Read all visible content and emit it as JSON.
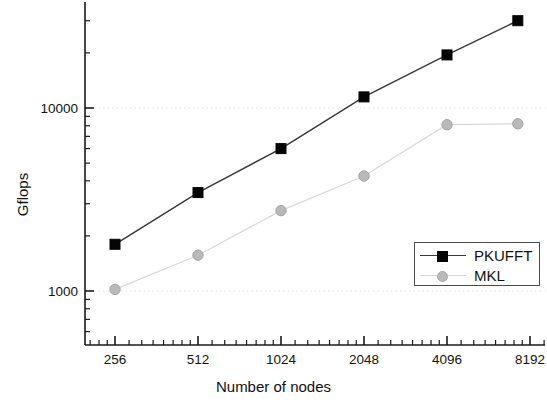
{
  "chart_data": {
    "type": "line",
    "title": "",
    "xlabel": "Number of nodes",
    "ylabel": "Gflops",
    "xscale": "log2",
    "yscale": "log10",
    "xlim": [
      210,
      10000
    ],
    "ylim": [
      520,
      38000
    ],
    "x": [
      256,
      512,
      1024,
      2048,
      4096,
      8192
    ],
    "xtick_labels": [
      "256",
      "512",
      "1024",
      "2048",
      "4096",
      "8192"
    ],
    "ytick_labels": [
      "10000",
      "1000"
    ],
    "ytick_values": [
      10000,
      1000
    ],
    "grid": "horizontal-dotted",
    "legend_position": "lower-right",
    "series": [
      {
        "name": "PKUFFT",
        "marker": "square",
        "color": "#050505",
        "line_color": "#3a3a3a",
        "x": [
          256,
          512,
          1024,
          2048,
          4096,
          7400
        ],
        "values": [
          1800,
          3450,
          6000,
          11500,
          19500,
          30000
        ]
      },
      {
        "name": "MKL",
        "marker": "circle",
        "color": "#b9b9b9",
        "line_color": "#d8d8d8",
        "x": [
          256,
          512,
          1024,
          2048,
          4096,
          7400
        ],
        "values": [
          1020,
          1570,
          2750,
          4250,
          8100,
          8200
        ]
      }
    ]
  },
  "axes": {
    "y_label": "Gflops",
    "x_label": "Number of nodes"
  },
  "legend": {
    "entries": [
      {
        "label": "PKUFFT"
      },
      {
        "label": "MKL"
      }
    ]
  },
  "colors": {
    "pkufft": "#050505",
    "mkl": "#b9b9b9",
    "axis": "#1a1a1a",
    "grid": "#e2e2e2",
    "background": "#ffffff"
  }
}
